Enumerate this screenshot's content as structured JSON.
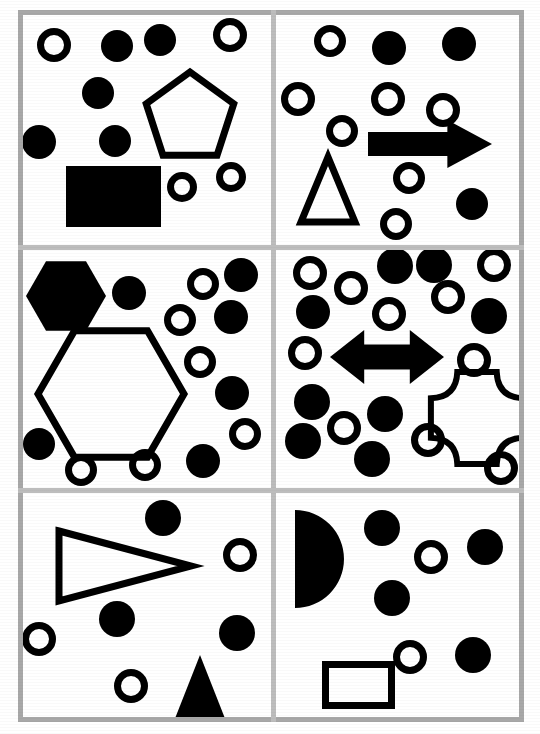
{
  "document": {
    "title": "Shape Array Panels",
    "width": 540,
    "height": 734,
    "background_color": "#ffffff",
    "ink_color": "#000000",
    "frame_color": "#a8a8a8",
    "divider_color": "#bdbdbd",
    "panel_count": 6,
    "grid_rows": 3,
    "grid_cols": 2
  },
  "frame": {
    "left": 18,
    "top": 10,
    "right": 524,
    "bottom": 722,
    "thickness": 5
  },
  "dividers": {
    "vertical_x": [
      271
    ],
    "horizontal_y": [
      245,
      488
    ],
    "thickness": 5
  },
  "panels": [
    {
      "id": "panel-top-left",
      "name": "top-left",
      "row": 0,
      "col": 0,
      "x": 22,
      "y": 14,
      "width": 249,
      "height": 231,
      "filled_circles": 5,
      "open_circles": 4,
      "shapes": [
        {
          "type": "circle-open",
          "name": "open-circle",
          "cx": 54,
          "cy": 45,
          "r": 17,
          "stroke": 7
        },
        {
          "type": "circle-filled",
          "name": "filled-circle",
          "cx": 117,
          "cy": 46,
          "r": 16
        },
        {
          "type": "circle-filled",
          "name": "filled-circle",
          "cx": 160,
          "cy": 40,
          "r": 16
        },
        {
          "type": "circle-open",
          "name": "open-circle",
          "cx": 230,
          "cy": 35,
          "r": 17,
          "stroke": 7
        },
        {
          "type": "circle-filled",
          "name": "filled-circle",
          "cx": 98,
          "cy": 93,
          "r": 16
        },
        {
          "type": "circle-filled",
          "name": "filled-circle",
          "cx": 39,
          "cy": 142,
          "r": 17
        },
        {
          "type": "circle-filled",
          "name": "filled-circle",
          "cx": 115,
          "cy": 141,
          "r": 16
        },
        {
          "type": "pentagon-open",
          "name": "pentagon",
          "cx": 190,
          "cy": 118,
          "r": 46,
          "stroke": 7
        },
        {
          "type": "rect-filled",
          "name": "filled-rectangle",
          "x": 66,
          "y": 166,
          "w": 95,
          "h": 61
        },
        {
          "type": "circle-open",
          "name": "open-circle",
          "cx": 182,
          "cy": 187,
          "r": 15,
          "stroke": 7
        },
        {
          "type": "circle-open",
          "name": "open-circle",
          "cx": 231,
          "cy": 177,
          "r": 15,
          "stroke": 7
        }
      ]
    },
    {
      "id": "panel-top-right",
      "name": "top-right",
      "row": 0,
      "col": 1,
      "x": 276,
      "y": 14,
      "width": 246,
      "height": 231,
      "filled_circles": 3,
      "open_circles": 6,
      "shapes": [
        {
          "type": "circle-open",
          "name": "open-circle",
          "cx": 330,
          "cy": 41,
          "r": 16,
          "stroke": 7
        },
        {
          "type": "circle-filled",
          "name": "filled-circle",
          "cx": 389,
          "cy": 48,
          "r": 17
        },
        {
          "type": "circle-filled",
          "name": "filled-circle",
          "cx": 459,
          "cy": 44,
          "r": 17
        },
        {
          "type": "circle-open",
          "name": "open-circle",
          "cx": 298,
          "cy": 99,
          "r": 17,
          "stroke": 7
        },
        {
          "type": "circle-open",
          "name": "open-circle",
          "cx": 388,
          "cy": 99,
          "r": 17,
          "stroke": 7
        },
        {
          "type": "circle-open",
          "name": "open-circle",
          "cx": 443,
          "cy": 110,
          "r": 17,
          "stroke": 7
        },
        {
          "type": "circle-open",
          "name": "open-circle",
          "cx": 342,
          "cy": 131,
          "r": 16,
          "stroke": 7
        },
        {
          "type": "arrow-right-filled",
          "name": "right-arrow",
          "x": 368,
          "y": 120,
          "w": 124,
          "h": 48
        },
        {
          "type": "triangle-open",
          "name": "triangle",
          "x": 301,
          "y": 157,
          "w": 54,
          "h": 65,
          "stroke": 7
        },
        {
          "type": "circle-open",
          "name": "open-circle",
          "cx": 409,
          "cy": 178,
          "r": 16,
          "stroke": 7
        },
        {
          "type": "circle-filled",
          "name": "filled-circle",
          "cx": 472,
          "cy": 204,
          "r": 16
        },
        {
          "type": "circle-open",
          "name": "open-circle",
          "cx": 396,
          "cy": 224,
          "r": 16,
          "stroke": 7
        }
      ]
    },
    {
      "id": "panel-middle-left",
      "name": "middle-left",
      "row": 1,
      "col": 0,
      "x": 22,
      "y": 250,
      "width": 249,
      "height": 238,
      "filled_circles": 6,
      "open_circles": 6,
      "shapes": [
        {
          "type": "hexagon-filled",
          "name": "filled-hexagon",
          "cx": 66,
          "cy": 296,
          "r": 40
        },
        {
          "type": "circle-filled",
          "name": "filled-circle",
          "cx": 129,
          "cy": 293,
          "r": 17
        },
        {
          "type": "circle-open",
          "name": "open-circle",
          "cx": 203,
          "cy": 284,
          "r": 16,
          "stroke": 7
        },
        {
          "type": "circle-filled",
          "name": "filled-circle",
          "cx": 241,
          "cy": 275,
          "r": 17
        },
        {
          "type": "circle-open",
          "name": "open-circle",
          "cx": 180,
          "cy": 320,
          "r": 16,
          "stroke": 7
        },
        {
          "type": "circle-filled",
          "name": "filled-circle",
          "cx": 231,
          "cy": 317,
          "r": 17
        },
        {
          "type": "hexagon-open",
          "name": "hexagon",
          "cx": 111,
          "cy": 394,
          "r": 73,
          "stroke": 7
        },
        {
          "type": "circle-open",
          "name": "open-circle",
          "cx": 200,
          "cy": 362,
          "r": 16,
          "stroke": 7
        },
        {
          "type": "circle-filled",
          "name": "filled-circle",
          "cx": 232,
          "cy": 393,
          "r": 17
        },
        {
          "type": "circle-open",
          "name": "open-circle",
          "cx": 245,
          "cy": 434,
          "r": 16,
          "stroke": 7
        },
        {
          "type": "circle-filled",
          "name": "filled-circle",
          "cx": 39,
          "cy": 444,
          "r": 16
        },
        {
          "type": "circle-open",
          "name": "open-circle",
          "cx": 81,
          "cy": 470,
          "r": 16,
          "stroke": 7
        },
        {
          "type": "circle-open",
          "name": "open-circle",
          "cx": 145,
          "cy": 465,
          "r": 16,
          "stroke": 7
        },
        {
          "type": "circle-filled",
          "name": "filled-circle",
          "cx": 203,
          "cy": 461,
          "r": 17
        }
      ]
    },
    {
      "id": "panel-middle-right",
      "name": "middle-right",
      "row": 1,
      "col": 1,
      "x": 276,
      "y": 250,
      "width": 246,
      "height": 238,
      "filled_circles": 9,
      "open_circles": 10,
      "shapes": [
        {
          "type": "circle-open",
          "name": "open-circle",
          "cx": 310,
          "cy": 273,
          "r": 17,
          "stroke": 7
        },
        {
          "type": "circle-open",
          "name": "open-circle",
          "cx": 351,
          "cy": 288,
          "r": 17,
          "stroke": 7
        },
        {
          "type": "circle-filled",
          "name": "filled-circle",
          "cx": 395,
          "cy": 266,
          "r": 18
        },
        {
          "type": "circle-filled",
          "name": "filled-circle",
          "cx": 434,
          "cy": 265,
          "r": 18
        },
        {
          "type": "circle-open",
          "name": "open-circle",
          "cx": 494,
          "cy": 265,
          "r": 17,
          "stroke": 7
        },
        {
          "type": "circle-filled",
          "name": "filled-circle",
          "cx": 313,
          "cy": 312,
          "r": 17
        },
        {
          "type": "circle-open",
          "name": "open-circle",
          "cx": 389,
          "cy": 314,
          "r": 17,
          "stroke": 7
        },
        {
          "type": "circle-open",
          "name": "open-circle",
          "cx": 448,
          "cy": 297,
          "r": 17,
          "stroke": 7
        },
        {
          "type": "circle-filled",
          "name": "filled-circle",
          "cx": 489,
          "cy": 316,
          "r": 18
        },
        {
          "type": "circle-open",
          "name": "open-circle",
          "cx": 305,
          "cy": 353,
          "r": 17,
          "stroke": 7
        },
        {
          "type": "arrow-double-filled",
          "name": "double-arrow",
          "x": 330,
          "y": 330,
          "w": 114,
          "h": 54
        },
        {
          "type": "circle-open",
          "name": "open-circle",
          "cx": 474,
          "cy": 360,
          "r": 17,
          "stroke": 7
        },
        {
          "type": "circle-filled",
          "name": "filled-circle",
          "cx": 312,
          "cy": 402,
          "r": 18
        },
        {
          "type": "star-cross-open",
          "name": "concave-cross",
          "cx": 477,
          "cy": 418,
          "r": 47,
          "stroke": 6
        },
        {
          "type": "circle-filled",
          "name": "filled-circle",
          "cx": 385,
          "cy": 414,
          "r": 18
        },
        {
          "type": "circle-open",
          "name": "open-circle",
          "cx": 344,
          "cy": 428,
          "r": 17,
          "stroke": 7
        },
        {
          "type": "circle-filled",
          "name": "filled-circle",
          "cx": 303,
          "cy": 441,
          "r": 18
        },
        {
          "type": "circle-open",
          "name": "open-circle",
          "cx": 428,
          "cy": 440,
          "r": 17,
          "stroke": 7
        },
        {
          "type": "circle-filled",
          "name": "filled-circle",
          "cx": 372,
          "cy": 459,
          "r": 18
        },
        {
          "type": "circle-open",
          "name": "open-circle",
          "cx": 501,
          "cy": 468,
          "r": 17,
          "stroke": 7
        }
      ]
    },
    {
      "id": "panel-bottom-left",
      "name": "bottom-left",
      "row": 2,
      "col": 0,
      "x": 22,
      "y": 493,
      "width": 249,
      "height": 226,
      "filled_circles": 3,
      "open_circles": 3,
      "shapes": [
        {
          "type": "circle-filled",
          "name": "filled-circle",
          "cx": 163,
          "cy": 518,
          "r": 18
        },
        {
          "type": "triangle-right-open",
          "name": "right-triangle",
          "x": 59,
          "y": 531,
          "w": 132,
          "h": 70,
          "stroke": 7
        },
        {
          "type": "circle-open",
          "name": "open-circle",
          "cx": 240,
          "cy": 555,
          "r": 17,
          "stroke": 7
        },
        {
          "type": "circle-filled",
          "name": "filled-circle",
          "cx": 117,
          "cy": 619,
          "r": 18
        },
        {
          "type": "circle-open",
          "name": "open-circle",
          "cx": 39,
          "cy": 639,
          "r": 17,
          "stroke": 7
        },
        {
          "type": "circle-filled",
          "name": "filled-circle",
          "cx": 237,
          "cy": 633,
          "r": 18
        },
        {
          "type": "triangle-up-filled",
          "name": "filled-triangle",
          "x": 174,
          "y": 655,
          "w": 52,
          "h": 66
        },
        {
          "type": "circle-open",
          "name": "open-circle",
          "cx": 131,
          "cy": 686,
          "r": 17,
          "stroke": 7
        }
      ]
    },
    {
      "id": "panel-bottom-right",
      "name": "bottom-right",
      "row": 2,
      "col": 1,
      "x": 276,
      "y": 493,
      "width": 246,
      "height": 226,
      "filled_circles": 5,
      "open_circles": 2,
      "shapes": [
        {
          "type": "semicircle-filled",
          "name": "half-disc",
          "cx": 295,
          "cy": 559,
          "r": 49
        },
        {
          "type": "circle-filled",
          "name": "filled-circle",
          "cx": 382,
          "cy": 528,
          "r": 18
        },
        {
          "type": "circle-open",
          "name": "open-circle",
          "cx": 431,
          "cy": 557,
          "r": 17,
          "stroke": 7
        },
        {
          "type": "circle-filled",
          "name": "filled-circle",
          "cx": 392,
          "cy": 598,
          "r": 18
        },
        {
          "type": "circle-filled",
          "name": "filled-circle",
          "cx": 485,
          "cy": 547,
          "r": 18
        },
        {
          "type": "circle-open",
          "name": "open-circle",
          "cx": 410,
          "cy": 657,
          "r": 17,
          "stroke": 7
        },
        {
          "type": "circle-filled",
          "name": "filled-circle",
          "cx": 473,
          "cy": 655,
          "r": 18
        },
        {
          "type": "rect-open",
          "name": "rectangle",
          "x": 322,
          "y": 661,
          "w": 73,
          "h": 48,
          "stroke": 7
        }
      ]
    }
  ]
}
